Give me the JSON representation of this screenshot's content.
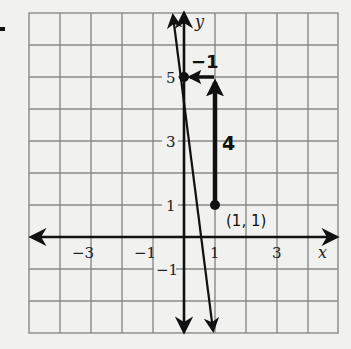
{
  "problem_marker": "-",
  "graph": {
    "x_axis_label": "x",
    "y_axis_label": "y",
    "x_range": [
      -5,
      5
    ],
    "y_range": [
      -3,
      7
    ],
    "x_tick_labels": [
      "-3",
      "-1",
      "1",
      "3"
    ],
    "y_tick_labels": [
      "5",
      "3",
      "1",
      "-1"
    ],
    "grid_color": "#8a8a8a",
    "ink_color": "#111111"
  },
  "line": {
    "slope": -4,
    "y_intercept": 5,
    "description": "line through (0, 5) and (1, 1)"
  },
  "points": [
    {
      "name": "y-intercept",
      "x": 0,
      "y": 5,
      "label": ""
    },
    {
      "name": "point",
      "x": 1,
      "y": 1,
      "label": "(1, 1)"
    }
  ],
  "slope_triangle": {
    "rise_label": "4",
    "run_label": "−1"
  }
}
